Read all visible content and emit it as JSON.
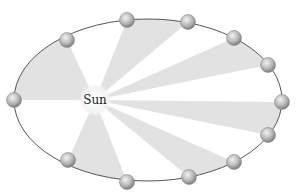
{
  "diagram": {
    "sun": {
      "label": "Sun",
      "x": 95,
      "y": 100
    },
    "orbit": {
      "cx": 148,
      "cy": 100,
      "rx": 134,
      "ry": 81
    },
    "planets": [
      {
        "x": 14,
        "y": 100
      },
      {
        "x": 67,
        "y": 40
      },
      {
        "x": 127,
        "y": 20
      },
      {
        "x": 188,
        "y": 22
      },
      {
        "x": 234,
        "y": 38
      },
      {
        "x": 268,
        "y": 65
      },
      {
        "x": 282,
        "y": 102
      },
      {
        "x": 268,
        "y": 135
      },
      {
        "x": 234,
        "y": 162
      },
      {
        "x": 189,
        "y": 177
      },
      {
        "x": 127,
        "y": 182
      },
      {
        "x": 68,
        "y": 160
      }
    ],
    "shaded_sectors": [
      {
        "from": 0,
        "to": 1
      },
      {
        "from": 2,
        "to": 3
      },
      {
        "from": 4,
        "to": 5
      },
      {
        "from": 6,
        "to": 7
      },
      {
        "from": 8,
        "to": 9
      },
      {
        "from": 10,
        "to": 11
      }
    ],
    "colors": {
      "orbit": "#555555",
      "sector": "#e2e2e2",
      "planet_light": "#e8e8e8",
      "planet_dark": "#8a8a8a",
      "sun_glow": "#f3f3f3"
    }
  }
}
